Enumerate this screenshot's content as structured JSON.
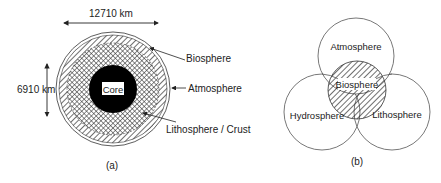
{
  "panel_a": {
    "caption": "(a)",
    "width_label": "12710 km",
    "height_label": "6910 km",
    "core_label": "Core",
    "labels": {
      "biosphere": "Biosphere",
      "atmosphere": "Atmosphere",
      "lithosphere": "Lithosphere / Crust"
    }
  },
  "panel_b": {
    "caption": "(b)",
    "circles": {
      "atmosphere": "Atmosphere",
      "hydrosphere": "Hydrosphere",
      "lithosphere": "Lithosphere",
      "biosphere": "Biosphere"
    }
  },
  "colors": {
    "ink": "#111111",
    "background": "#ffffff"
  }
}
